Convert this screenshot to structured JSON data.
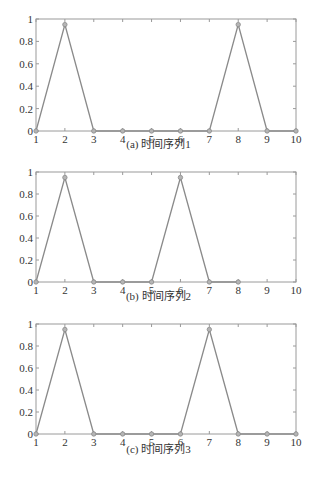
{
  "chart_data": [
    {
      "type": "line",
      "title": "",
      "caption": "(a) 时间序列1",
      "xlabel": "",
      "ylabel": "",
      "x": [
        1,
        2,
        3,
        4,
        5,
        6,
        7,
        8,
        9,
        10
      ],
      "series": [
        {
          "name": "时间序列1",
          "values": [
            0,
            0.95,
            0,
            0,
            0,
            0,
            0,
            0.95,
            0,
            0
          ]
        }
      ],
      "xlim": [
        1,
        10
      ],
      "ylim": [
        0,
        1
      ],
      "xticks": [
        "1",
        "2",
        "3",
        "4",
        "5",
        "6",
        "7",
        "8",
        "9",
        "10"
      ],
      "yticks": [
        "0",
        "0.2",
        "0.4",
        "0.6",
        "0.8",
        "1"
      ],
      "grid": false,
      "legend": "none",
      "line_color": "#8a8a8a",
      "marker": "circle"
    },
    {
      "type": "line",
      "title": "",
      "caption": "(b) 时间序列2",
      "xlabel": "",
      "ylabel": "",
      "x": [
        1,
        2,
        3,
        4,
        5,
        6,
        7,
        8
      ],
      "series": [
        {
          "name": "时间序列2",
          "values": [
            0,
            0.95,
            0,
            0,
            0,
            0.95,
            0,
            0
          ]
        }
      ],
      "xlim": [
        1,
        10
      ],
      "ylim": [
        0,
        1
      ],
      "xticks": [
        "1",
        "2",
        "3",
        "4",
        "5",
        "6",
        "7",
        "8",
        "9",
        "10"
      ],
      "yticks": [
        "0",
        "0.2",
        "0.4",
        "0.6",
        "0.8",
        "1"
      ],
      "grid": false,
      "legend": "none",
      "line_color": "#8a8a8a",
      "marker": "circle"
    },
    {
      "type": "line",
      "title": "",
      "caption": "(c) 时间序列3",
      "xlabel": "",
      "ylabel": "",
      "x": [
        1,
        2,
        3,
        4,
        5,
        6,
        7,
        8,
        9,
        10
      ],
      "series": [
        {
          "name": "时间序列3",
          "values": [
            0,
            0.95,
            0,
            0,
            0,
            0,
            0.95,
            0,
            0,
            0
          ]
        }
      ],
      "xlim": [
        1,
        10
      ],
      "ylim": [
        0,
        1
      ],
      "xticks": [
        "1",
        "2",
        "3",
        "4",
        "5",
        "6",
        "7",
        "8",
        "9",
        "10"
      ],
      "yticks": [
        "0",
        "0.2",
        "0.4",
        "0.6",
        "0.8",
        "1"
      ],
      "grid": false,
      "legend": "none",
      "line_color": "#8a8a8a",
      "marker": "circle"
    }
  ],
  "figure_caption": ""
}
